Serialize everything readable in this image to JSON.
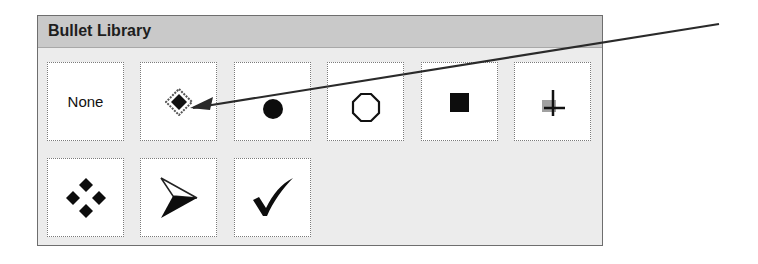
{
  "panel": {
    "title": "Bullet Library",
    "tiles": [
      {
        "label": "None",
        "icon": null
      },
      {
        "icon": "diamond-bullet-icon"
      },
      {
        "icon": "filled-circle-bullet-icon"
      },
      {
        "icon": "hollow-circle-bullet-icon"
      },
      {
        "icon": "filled-square-bullet-icon"
      },
      {
        "icon": "arrow-cross-bullet-icon"
      },
      {
        "icon": "four-diamond-bullet-icon"
      },
      {
        "icon": "arrowhead-bullet-icon"
      },
      {
        "icon": "checkmark-bullet-icon"
      }
    ]
  },
  "annotation": {
    "type": "arrow",
    "color": "#2a2a2a",
    "points_to": "diamond-bullet-tile"
  }
}
